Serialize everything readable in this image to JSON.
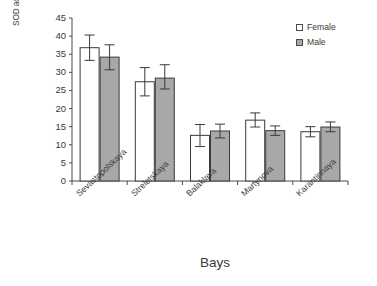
{
  "chart_data": {
    "type": "bar",
    "title": "",
    "xlabel": "Bays",
    "ylabel_line1": "SOD activity, x100 arbitrary units/ml",
    "ylabel_line2": "erythrocytes/min",
    "categories": [
      "Sevastopolskaya",
      "Streletskaya",
      "Balaklava",
      "Martynova",
      "Karantinnaya"
    ],
    "series": [
      {
        "name": "Female",
        "color": "#ffffff",
        "edge_color": "#3a3a3a",
        "values": [
          36.8,
          27.4,
          12.6,
          16.8,
          13.6
        ],
        "errors_low": [
          33.3,
          23.5,
          9.5,
          14.9,
          12.2
        ],
        "errors_high": [
          40.3,
          31.3,
          15.6,
          18.8,
          15.0
        ]
      },
      {
        "name": "Male",
        "color": "#a8a8a8",
        "edge_color": "#3a3a3a",
        "values": [
          34.2,
          28.4,
          13.8,
          13.9,
          14.9
        ],
        "errors_low": [
          30.7,
          25.4,
          11.9,
          12.6,
          13.6
        ],
        "errors_high": [
          37.6,
          32.1,
          15.7,
          15.2,
          16.3
        ]
      }
    ],
    "yticks": [
      0,
      5,
      10,
      15,
      20,
      25,
      30,
      35,
      40,
      45
    ],
    "ylim": [
      0,
      45
    ],
    "grid": false,
    "legend_position": "top-right",
    "error_bar_style": "capped"
  },
  "legend": {
    "items": [
      {
        "label": "Female",
        "swatch": "open-square-icon"
      },
      {
        "label": "Male",
        "swatch": "filled-square-icon"
      }
    ]
  },
  "axes": {
    "y_tick_labels": [
      "45",
      "40",
      "35",
      "30",
      "25",
      "20",
      "15",
      "10",
      "5",
      "0"
    ],
    "x_title": "Bays"
  }
}
